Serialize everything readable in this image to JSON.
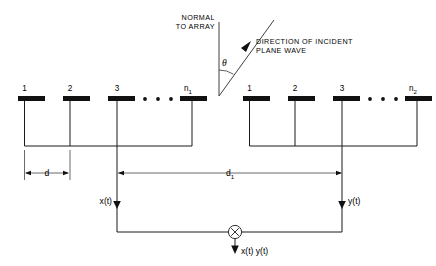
{
  "diagram": {
    "title_labels": {
      "normal_line1": "NORMAL",
      "normal_line2": "TO ARRAY",
      "direction_line1": "DIRECTION OF INCIDENT",
      "direction_line2": "PLANE WAVE",
      "angle_symbol": "θ"
    },
    "array_left": {
      "name": "array-1",
      "element_labels": [
        "1",
        "2",
        "3"
      ],
      "last_label_base": "n",
      "last_label_sub": "1",
      "ellipsis_dots": 3,
      "output_signal": "x(t)"
    },
    "array_right": {
      "name": "array-2",
      "element_labels": [
        "1",
        "2",
        "3"
      ],
      "last_label_base": "n",
      "last_label_sub": "2",
      "ellipsis_dots": 3,
      "output_signal": "y(t)"
    },
    "dimensions": {
      "element_spacing_label": "d",
      "array_separation_base": "d",
      "array_separation_sub": "1"
    },
    "multiplier": {
      "symbol": "×",
      "output_label": "x(t) y(t)"
    },
    "colors": {
      "ink": "#111111",
      "wire": "#1a1a1a",
      "background": "#ffffff"
    }
  }
}
